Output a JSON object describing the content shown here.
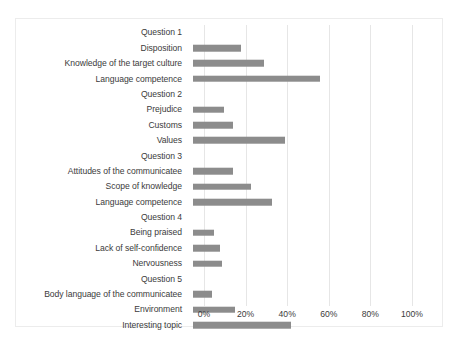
{
  "chart_data": {
    "type": "bar",
    "orientation": "horizontal",
    "title": "",
    "xlabel": "",
    "ylabel": "",
    "xlim": [
      0,
      100
    ],
    "xticks": [
      0,
      20,
      40,
      60,
      80,
      100
    ],
    "xtick_labels": [
      "0%",
      "20%",
      "40%",
      "60%",
      "80%",
      "100%"
    ],
    "grid": true,
    "legend": false,
    "bar_color": "#8c8c8c",
    "gridline_color": "#e6e6e6",
    "border_color": "#ececec",
    "text_color": "#3b3b3b",
    "categories": [
      "Question 1",
      "Disposition",
      "Knowledge of the target culture",
      "Language competence",
      "Question 2",
      "Prejudice",
      "Customs",
      "Values",
      "Question 3",
      "Attitudes of the communicatee",
      "Scope of knowledge",
      "Language competence",
      "Question 4",
      "Being praised",
      "Lack of self-confidence",
      "Nervousness",
      "Question 5",
      "Body language of the communicatee",
      "Environment",
      "Interesting topic"
    ],
    "values": [
      0,
      23,
      34,
      61,
      0,
      15,
      19,
      44,
      0,
      19,
      28,
      38,
      0,
      10,
      13,
      14,
      0,
      9,
      20,
      47
    ],
    "group_headers": [
      "Question 1",
      "Question 2",
      "Question 3",
      "Question 4",
      "Question 5"
    ]
  }
}
